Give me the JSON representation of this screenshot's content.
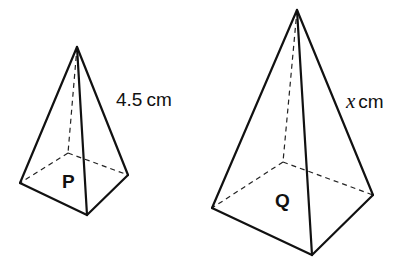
{
  "diagram": {
    "type": "similar square-based pyramids",
    "shapes": [
      {
        "id": "P",
        "label": "P",
        "slant_edge_label": "4.5 cm",
        "slant_edge_value": "4.5",
        "slant_edge_unit": "cm",
        "vertices": {
          "apex": [
            77,
            47
          ],
          "base_left": [
            20,
            183
          ],
          "base_front": [
            87,
            215
          ],
          "base_right": [
            128,
            175
          ],
          "base_back": [
            68,
            153
          ]
        }
      },
      {
        "id": "Q",
        "label": "Q",
        "slant_edge_label": "x cm",
        "slant_edge_variable": "x",
        "slant_edge_unit": "cm",
        "vertices": {
          "apex": [
            297,
            10
          ],
          "base_left": [
            212,
            208
          ],
          "base_front": [
            312,
            255
          ],
          "base_right": [
            373,
            195
          ],
          "base_back": [
            283,
            162
          ]
        }
      }
    ],
    "colors": {
      "line": "#111111",
      "background": "#ffffff"
    }
  }
}
